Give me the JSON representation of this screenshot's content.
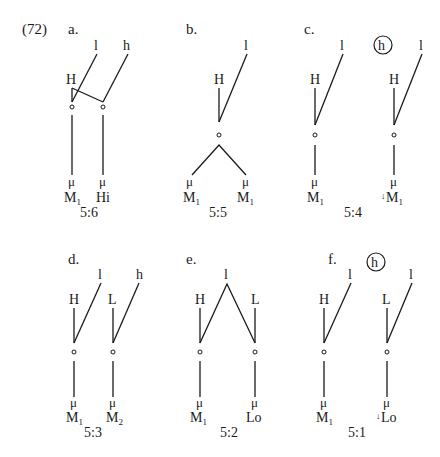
{
  "example_number": "(72)",
  "panels": [
    {
      "id": "a",
      "label": "a.",
      "ratio": "5:6",
      "tiers": {
        "top": [
          "l",
          "h"
        ],
        "register": [
          "H"
        ],
        "surface": [
          "M",
          "Hi"
        ]
      },
      "surface_subscripts": [
        "1",
        ""
      ],
      "mora": "μ",
      "circled_top": null,
      "downstep": [
        false,
        false
      ]
    },
    {
      "id": "b",
      "label": "b.",
      "ratio": "5:5",
      "tiers": {
        "top": [
          "l"
        ],
        "register": [
          "H"
        ],
        "surface": [
          "M",
          "M"
        ]
      },
      "surface_subscripts": [
        "1",
        "1"
      ],
      "mora": "μ",
      "circled_top": null,
      "downstep": [
        false,
        false
      ]
    },
    {
      "id": "c",
      "label": "c.",
      "ratio": "5:4",
      "tiers": {
        "top": [
          "l",
          "l"
        ],
        "register": [
          "H",
          "H"
        ],
        "surface": [
          "M",
          "M"
        ]
      },
      "surface_subscripts": [
        "1",
        "1"
      ],
      "mora": "μ",
      "circled_top": "h",
      "downstep": [
        false,
        true
      ]
    },
    {
      "id": "d",
      "label": "d.",
      "ratio": "5:3",
      "tiers": {
        "top": [
          "l",
          "h"
        ],
        "register": [
          "H",
          "L"
        ],
        "surface": [
          "M",
          "M"
        ]
      },
      "surface_subscripts": [
        "1",
        "2"
      ],
      "mora": "μ",
      "circled_top": null,
      "downstep": [
        false,
        false
      ]
    },
    {
      "id": "e",
      "label": "e.",
      "ratio": "5:2",
      "tiers": {
        "top": [
          "l"
        ],
        "register": [
          "H",
          "L"
        ],
        "surface": [
          "M",
          "Lo"
        ]
      },
      "surface_subscripts": [
        "1",
        ""
      ],
      "mora": "μ",
      "circled_top": null,
      "downstep": [
        false,
        false
      ]
    },
    {
      "id": "f",
      "label": "f.",
      "ratio": "5:1",
      "tiers": {
        "top": [
          "l",
          "l"
        ],
        "register": [
          "H",
          "L"
        ],
        "surface": [
          "M",
          "Lo"
        ]
      },
      "surface_subscripts": [
        "1",
        ""
      ],
      "mora": "μ",
      "circled_top": "h",
      "downstep": [
        false,
        true
      ]
    }
  ],
  "glyphs": {
    "downstep": "↓"
  }
}
